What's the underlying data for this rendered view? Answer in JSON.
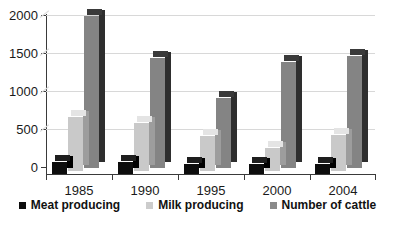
{
  "chart_data": {
    "type": "bar",
    "title": "",
    "subtitle": "",
    "xlabel": "",
    "ylabel": "",
    "categories": [
      "1985",
      "1990",
      "1995",
      "2000",
      "2004"
    ],
    "yticks": [
      "0",
      "500",
      "1000",
      "1500",
      "2000"
    ],
    "ylim": [
      0,
      2000
    ],
    "grid": true,
    "legend_position": "bottom",
    "style": "3d-clustered-column",
    "series": [
      {
        "name": "Meat producing",
        "color": "#0d0d0d",
        "values": [
          150,
          150,
          120,
          120,
          130
        ]
      },
      {
        "name": "Milk producing",
        "color": "#c9c9c9",
        "values": [
          680,
          600,
          440,
          290,
          450
        ]
      },
      {
        "name": "Number of cattle",
        "color": "#848484",
        "values": [
          1900,
          1380,
          880,
          1330,
          1400
        ]
      }
    ]
  },
  "legend": {
    "items": [
      {
        "label": "Meat producing"
      },
      {
        "label": "Milk producing"
      },
      {
        "label": "Number of cattle"
      }
    ]
  }
}
